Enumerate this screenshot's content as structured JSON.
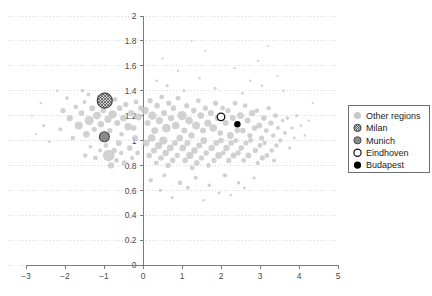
{
  "chart_data": {
    "type": "scatter",
    "title": "",
    "xlabel": "",
    "ylabel": "",
    "xlim": [
      -3,
      5
    ],
    "ylim": [
      0,
      2
    ],
    "xticks": [
      "-3",
      "-2",
      "-1",
      "0",
      "1",
      "2",
      "3",
      "4",
      "5"
    ],
    "xtick_values": [
      -3,
      -2,
      -1,
      0,
      1,
      2,
      3,
      4,
      5
    ],
    "yticks": [
      "0",
      "0.2",
      "0.4",
      "0.6",
      "0.8",
      "1",
      "1.2",
      "1.4",
      "1.6",
      "1.8",
      "2"
    ],
    "ytick_values": [
      0,
      0.2,
      0.4,
      0.6,
      0.8,
      1.0,
      1.2,
      1.4,
      1.6,
      1.8,
      2.0
    ],
    "grid": "horizontal-dotted",
    "legend_position": "right",
    "marker_style": "bubble-size-varies",
    "colors": {
      "other_regions": "#c9c9c9",
      "milan_fill": "#bdbdbd",
      "milan_edge": "#3f3f3f",
      "munich_fill": "#8a8a8a",
      "munich_edge": "#4a4a4a",
      "eindhoven_fill": "#ffffff",
      "eindhoven_edge": "#111111",
      "budapest_fill": "#000000",
      "axis": "#7b7b7b",
      "grid": "#d9d9d9",
      "text": "#333333",
      "background": "#ffffff"
    },
    "series": [
      {
        "name": "Other regions",
        "marker": "filled-circle-light-gray",
        "points": [
          [
            -2.55,
            1.12,
            1.6
          ],
          [
            -2.4,
            0.99,
            1.4
          ],
          [
            -2.62,
            1.3,
            1.2
          ],
          [
            -2.05,
            1.24,
            2.6
          ],
          [
            -2.12,
            1.09,
            2.0
          ],
          [
            -1.95,
            1.34,
            1.8
          ],
          [
            -1.88,
            1.18,
            3.2
          ],
          [
            -1.72,
            1.27,
            2.4
          ],
          [
            -1.8,
            1.02,
            2.2
          ],
          [
            -1.65,
            1.12,
            4.0
          ],
          [
            -1.58,
            1.22,
            2.8
          ],
          [
            -1.5,
            1.31,
            2.0
          ],
          [
            -1.45,
            1.05,
            3.4
          ],
          [
            -1.38,
            1.16,
            4.6
          ],
          [
            -1.3,
            1.26,
            3.0
          ],
          [
            -1.25,
            1.09,
            2.6
          ],
          [
            -1.18,
            1.2,
            3.8
          ],
          [
            -1.12,
            1.35,
            2.4
          ],
          [
            -1.4,
            1.37,
            2.0
          ],
          [
            -1.55,
            1.4,
            1.8
          ],
          [
            -1.08,
            1.13,
            3.2
          ],
          [
            -1.02,
            1.24,
            2.8
          ],
          [
            -0.96,
            1.3,
            2.2
          ],
          [
            -0.9,
            1.17,
            3.6
          ],
          [
            -0.85,
            1.08,
            2.6
          ],
          [
            -0.78,
            1.21,
            4.2
          ],
          [
            -0.72,
            1.33,
            2.4
          ],
          [
            -0.66,
            1.14,
            3.0
          ],
          [
            -0.6,
            1.26,
            2.8
          ],
          [
            -0.55,
            1.05,
            2.2
          ],
          [
            -0.5,
            1.18,
            3.4
          ],
          [
            -0.44,
            1.29,
            2.6
          ],
          [
            -0.38,
            1.11,
            3.8
          ],
          [
            -0.95,
            0.96,
            2.4
          ],
          [
            -0.88,
            0.88,
            5.8
          ],
          [
            -0.82,
            0.8,
            3.2
          ],
          [
            -0.74,
            0.92,
            2.8
          ],
          [
            -0.68,
            0.84,
            2.4
          ],
          [
            -0.62,
            0.98,
            3.0
          ],
          [
            -0.56,
            0.9,
            2.2
          ],
          [
            -0.48,
            0.82,
            2.6
          ],
          [
            -1.1,
            0.92,
            2.0
          ],
          [
            -1.22,
            0.86,
            2.4
          ],
          [
            -1.35,
            0.95,
            1.8
          ],
          [
            -1.48,
            0.88,
            2.2
          ],
          [
            -0.3,
            1.22,
            3.2
          ],
          [
            -0.24,
            1.1,
            2.8
          ],
          [
            -0.18,
            1.31,
            2.4
          ],
          [
            -0.12,
            1.19,
            3.6
          ],
          [
            -0.06,
            1.26,
            2.6
          ],
          [
            -0.34,
            0.94,
            2.8
          ],
          [
            -0.28,
            0.86,
            2.2
          ],
          [
            -0.2,
            1.02,
            3.0
          ],
          [
            -0.14,
            0.9,
            2.4
          ],
          [
            0.05,
            1.24,
            3.8
          ],
          [
            0.12,
            1.14,
            3.0
          ],
          [
            0.18,
            1.32,
            2.6
          ],
          [
            0.24,
            1.2,
            4.2
          ],
          [
            0.3,
            1.08,
            3.4
          ],
          [
            0.36,
            1.28,
            2.8
          ],
          [
            0.42,
            1.16,
            3.6
          ],
          [
            0.48,
            1.35,
            2.4
          ],
          [
            0.54,
            1.22,
            3.0
          ],
          [
            0.6,
            1.1,
            4.4
          ],
          [
            0.66,
            1.3,
            2.6
          ],
          [
            0.72,
            1.18,
            3.2
          ],
          [
            0.78,
            1.26,
            2.8
          ],
          [
            0.84,
            1.12,
            3.8
          ],
          [
            0.9,
            1.34,
            2.4
          ],
          [
            0.08,
            0.98,
            3.4
          ],
          [
            0.16,
            0.88,
            2.8
          ],
          [
            0.22,
            1.02,
            3.8
          ],
          [
            0.28,
            0.92,
            3.0
          ],
          [
            0.34,
            0.82,
            2.4
          ],
          [
            0.4,
            0.96,
            3.6
          ],
          [
            0.46,
            0.86,
            2.8
          ],
          [
            0.52,
            1.0,
            4.0
          ],
          [
            0.58,
            0.9,
            3.2
          ],
          [
            0.64,
            0.8,
            2.6
          ],
          [
            0.7,
            0.94,
            3.4
          ],
          [
            0.76,
            0.84,
            2.8
          ],
          [
            0.82,
            0.98,
            3.0
          ],
          [
            0.88,
            0.88,
            2.6
          ],
          [
            0.94,
            1.02,
            3.2
          ],
          [
            1.0,
            1.2,
            4.6
          ],
          [
            1.06,
            1.08,
            3.0
          ],
          [
            1.12,
            1.28,
            2.6
          ],
          [
            1.18,
            1.16,
            3.8
          ],
          [
            1.24,
            1.04,
            3.2
          ],
          [
            1.3,
            1.24,
            2.8
          ],
          [
            1.36,
            1.12,
            4.0
          ],
          [
            1.42,
            1.32,
            2.4
          ],
          [
            1.48,
            1.2,
            3.4
          ],
          [
            1.54,
            1.08,
            3.0
          ],
          [
            1.6,
            1.26,
            2.6
          ],
          [
            1.66,
            1.14,
            3.6
          ],
          [
            1.02,
            0.94,
            3.4
          ],
          [
            1.08,
            0.84,
            2.8
          ],
          [
            1.14,
            0.98,
            3.0
          ],
          [
            1.2,
            0.88,
            3.6
          ],
          [
            1.26,
            0.78,
            2.4
          ],
          [
            1.32,
            0.92,
            3.2
          ],
          [
            1.38,
            0.82,
            2.8
          ],
          [
            1.44,
            0.96,
            3.0
          ],
          [
            1.5,
            0.86,
            2.6
          ],
          [
            1.56,
            1.0,
            3.4
          ],
          [
            1.62,
            0.9,
            2.8
          ],
          [
            1.68,
            0.8,
            2.4
          ],
          [
            1.74,
            1.22,
            3.0
          ],
          [
            1.8,
            1.1,
            3.8
          ],
          [
            1.86,
            1.3,
            2.6
          ],
          [
            1.92,
            1.18,
            3.2
          ],
          [
            1.98,
            1.06,
            2.8
          ],
          [
            2.04,
            1.26,
            2.4
          ],
          [
            1.76,
            0.94,
            3.2
          ],
          [
            1.82,
            0.84,
            2.6
          ],
          [
            1.88,
            0.98,
            3.0
          ],
          [
            1.94,
            0.88,
            3.4
          ],
          [
            2.0,
            1.0,
            2.8
          ],
          [
            2.06,
            0.9,
            2.4
          ],
          [
            2.12,
            1.14,
            3.0
          ],
          [
            2.18,
            1.24,
            2.6
          ],
          [
            2.24,
            1.04,
            3.4
          ],
          [
            2.3,
            1.18,
            3.0
          ],
          [
            2.36,
            1.3,
            2.4
          ],
          [
            2.42,
            1.08,
            2.8
          ],
          [
            2.14,
            0.94,
            3.2
          ],
          [
            2.2,
            0.84,
            2.6
          ],
          [
            2.26,
            0.98,
            2.8
          ],
          [
            2.32,
            0.88,
            3.0
          ],
          [
            2.38,
            1.0,
            2.4
          ],
          [
            2.44,
            0.9,
            2.6
          ],
          [
            2.5,
            1.2,
            3.4
          ],
          [
            2.56,
            1.08,
            2.8
          ],
          [
            2.62,
            1.28,
            2.4
          ],
          [
            2.68,
            1.16,
            3.0
          ],
          [
            2.74,
            1.04,
            2.6
          ],
          [
            2.8,
            1.22,
            3.2
          ],
          [
            2.52,
            0.94,
            2.8
          ],
          [
            2.58,
            0.84,
            2.4
          ],
          [
            2.64,
            0.98,
            2.6
          ],
          [
            2.7,
            0.88,
            3.0
          ],
          [
            2.76,
            1.0,
            2.4
          ],
          [
            2.86,
            1.1,
            2.8
          ],
          [
            2.92,
            1.24,
            2.4
          ],
          [
            2.98,
            1.12,
            3.0
          ],
          [
            3.04,
            1.02,
            2.6
          ],
          [
            3.1,
            1.18,
            2.8
          ],
          [
            3.16,
            1.08,
            2.4
          ],
          [
            3.22,
            1.26,
            2.2
          ],
          [
            2.88,
            0.92,
            2.6
          ],
          [
            2.94,
            0.82,
            2.2
          ],
          [
            3.0,
            0.96,
            2.4
          ],
          [
            3.06,
            0.86,
            2.6
          ],
          [
            3.12,
            0.98,
            2.2
          ],
          [
            3.18,
            0.88,
            2.4
          ],
          [
            3.28,
            1.14,
            2.6
          ],
          [
            3.34,
            1.04,
            2.2
          ],
          [
            3.4,
            1.2,
            2.4
          ],
          [
            3.46,
            1.1,
            2.0
          ],
          [
            3.52,
            1.0,
            2.2
          ],
          [
            3.58,
            1.16,
            1.8
          ],
          [
            3.3,
            0.92,
            2.2
          ],
          [
            3.36,
            0.84,
            2.0
          ],
          [
            3.42,
            0.96,
            2.2
          ],
          [
            3.64,
            1.06,
            2.0
          ],
          [
            3.7,
            1.18,
            1.8
          ],
          [
            3.76,
            0.94,
            1.6
          ],
          [
            3.82,
            1.1,
            1.8
          ],
          [
            3.88,
            1.02,
            1.4
          ],
          [
            3.94,
            1.2,
            1.6
          ],
          [
            4.05,
            1.12,
            1.4
          ],
          [
            4.15,
            1.04,
            1.2
          ],
          [
            4.25,
            1.16,
            1.2
          ],
          [
            0.2,
            0.68,
            2.2
          ],
          [
            0.55,
            0.72,
            2.0
          ],
          [
            0.95,
            0.66,
            2.4
          ],
          [
            1.35,
            0.7,
            2.0
          ],
          [
            1.7,
            0.64,
            1.8
          ],
          [
            2.1,
            0.72,
            2.2
          ],
          [
            2.45,
            0.66,
            1.8
          ],
          [
            2.85,
            0.7,
            1.6
          ],
          [
            1.15,
            0.62,
            2.0
          ],
          [
            0.45,
            0.6,
            1.6
          ],
          [
            1.95,
            0.58,
            1.6
          ],
          [
            2.6,
            0.62,
            1.4
          ],
          [
            0.75,
            0.54,
            1.4
          ],
          [
            1.55,
            0.52,
            1.3
          ],
          [
            2.25,
            0.56,
            1.3
          ],
          [
            0.62,
            1.44,
            1.6
          ],
          [
            1.05,
            1.4,
            1.4
          ],
          [
            1.85,
            1.42,
            1.5
          ],
          [
            2.55,
            1.38,
            1.4
          ],
          [
            3.05,
            1.44,
            1.3
          ],
          [
            3.6,
            1.4,
            1.2
          ],
          [
            0.35,
            1.48,
            1.3
          ],
          [
            1.45,
            1.5,
            1.2
          ],
          [
            2.75,
            1.48,
            1.2
          ],
          [
            0.9,
            1.56,
            1.2
          ],
          [
            2.35,
            1.58,
            1.2
          ],
          [
            3.45,
            1.52,
            1.1
          ],
          [
            0.5,
            1.66,
            1.1
          ],
          [
            1.6,
            1.72,
            1.1
          ],
          [
            2.95,
            1.64,
            1.1
          ],
          [
            1.25,
            1.8,
            1.0
          ],
          [
            3.2,
            1.76,
            1.0
          ],
          [
            4.35,
            1.3,
            1.1
          ],
          [
            -2.85,
            1.2,
            1.0
          ],
          [
            -2.75,
            1.05,
            1.1
          ],
          [
            -2.2,
            1.4,
            1.2
          ]
        ]
      },
      {
        "name": "Milan",
        "marker": "hatched-circle",
        "points": [
          [
            -0.98,
            1.32,
            7.5
          ]
        ]
      },
      {
        "name": "Munich",
        "marker": "filled-circle-dark-gray",
        "points": [
          [
            -0.99,
            1.03,
            5.0
          ]
        ]
      },
      {
        "name": "Eindhoven",
        "marker": "open-circle",
        "points": [
          [
            2.0,
            1.19,
            3.8
          ]
        ]
      },
      {
        "name": "Budapest",
        "marker": "filled-circle-black",
        "points": [
          [
            2.42,
            1.13,
            3.2
          ]
        ]
      }
    ]
  },
  "legend": {
    "entries": [
      {
        "label": "Other regions",
        "marker": "filled-circle-light-gray"
      },
      {
        "label": "Milan",
        "marker": "hatched-circle"
      },
      {
        "label": "Munich",
        "marker": "filled-circle-dark-gray"
      },
      {
        "label": "Eindhoven",
        "marker": "open-circle"
      },
      {
        "label": "Budapest",
        "marker": "filled-circle-black"
      }
    ]
  }
}
